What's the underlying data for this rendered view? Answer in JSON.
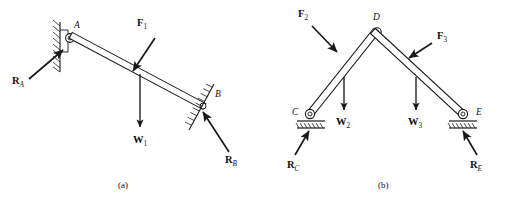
{
  "figure": {
    "title_caption_a": "(a)",
    "title_caption_b": "(b)",
    "line_color": "#1a1a1a",
    "hatch_color": "#1a1a1a",
    "background": "#ffffff"
  },
  "panel_a": {
    "caption": "(a)",
    "joint_labels": [
      {
        "name": "A",
        "text": "A",
        "x": 74,
        "y": 27
      },
      {
        "name": "B",
        "text": "B",
        "x": 214,
        "y": 96
      }
    ],
    "force_labels": [
      {
        "name": "F1",
        "letter": "F",
        "sub": "1",
        "x": 138,
        "y": 24
      },
      {
        "name": "W1",
        "letter": "W",
        "sub": "1",
        "x": 135,
        "y": 142
      },
      {
        "name": "RA",
        "letter": "R",
        "sub": "A",
        "x": 14,
        "y": 80
      },
      {
        "name": "RB",
        "letter": "R",
        "sub": "B",
        "x": 226,
        "y": 160
      }
    ],
    "bar": {
      "from": "A",
      "to": "B",
      "start_x": 74,
      "start_y": 40,
      "end_x": 205,
      "end_y": 110
    },
    "supports": {
      "A": {
        "type": "pin-on-wall",
        "x": 66,
        "y": 40
      },
      "B": {
        "type": "inclined-surface",
        "x": 205,
        "y": 110
      }
    }
  },
  "panel_b": {
    "caption": "(b)",
    "joint_labels": [
      {
        "name": "D",
        "text": "D",
        "x": 373,
        "y": 18
      },
      {
        "name": "C",
        "text": "C",
        "x": 293,
        "y": 113
      },
      {
        "name": "E",
        "text": "E",
        "x": 475,
        "y": 113
      }
    ],
    "force_labels": [
      {
        "name": "F2",
        "letter": "F",
        "sub": "2",
        "x": 300,
        "y": 14
      },
      {
        "name": "F3",
        "letter": "F",
        "sub": "3",
        "x": 436,
        "y": 36
      },
      {
        "name": "W2",
        "letter": "W",
        "sub": "2",
        "x": 337,
        "y": 122
      },
      {
        "name": "W3",
        "letter": "W",
        "sub": "3",
        "x": 408,
        "y": 122
      },
      {
        "name": "RC",
        "letter": "R",
        "sub": "C",
        "x": 289,
        "y": 165
      },
      {
        "name": "RE",
        "letter": "R",
        "sub": "E",
        "x": 468,
        "y": 165
      }
    ],
    "bars": [
      {
        "name": "CD",
        "start_x": 310,
        "start_y": 116,
        "end_x": 377,
        "end_y": 32
      },
      {
        "name": "DE",
        "start_x": 377,
        "start_y": 32,
        "end_x": 463,
        "end_y": 116
      }
    ],
    "supports": {
      "C": {
        "type": "pin-on-ground",
        "x": 310,
        "y": 116
      },
      "D": {
        "type": "pin-joint",
        "x": 377,
        "y": 32
      },
      "E": {
        "type": "pin-on-ground",
        "x": 463,
        "y": 116
      }
    }
  }
}
